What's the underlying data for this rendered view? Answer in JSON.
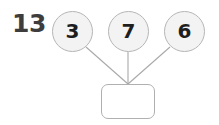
{
  "worksheet": {
    "type": "number-bond-addition",
    "total": "13",
    "addends": [
      {
        "value": "3"
      },
      {
        "value": "7"
      },
      {
        "value": "6"
      }
    ],
    "answer_box": {
      "value": "",
      "placeholder": ""
    }
  },
  "colors": {
    "background": "#ffffff",
    "total_text": "#3d3d3d",
    "circle_fill": "#f3f3f3",
    "circle_stroke": "#b6b6b6",
    "circle_text": "#1e1e1e",
    "connector_line": "#a9a9a9",
    "answer_box_stroke": "#b0b0b0",
    "answer_box_fill": "#ffffff"
  },
  "geometry": {
    "width": 219,
    "height": 125,
    "circle_centers": [
      {
        "x": 72,
        "y": 32
      },
      {
        "x": 128,
        "y": 32
      },
      {
        "x": 184,
        "y": 32
      }
    ],
    "circle_radius": 20,
    "junction": {
      "x": 128,
      "y": 84
    }
  }
}
